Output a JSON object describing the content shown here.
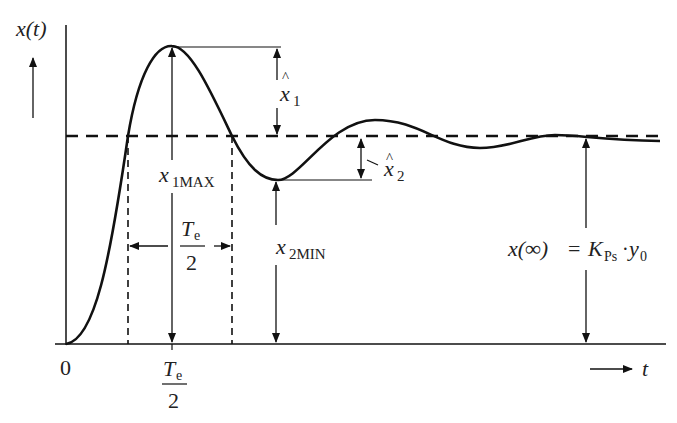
{
  "diagram": {
    "type": "step-response-overshoot",
    "y_axis_label": "x(t)",
    "x_axis_label": "t",
    "origin_label": "0",
    "labels": {
      "x1_hat": {
        "base": "x",
        "hat": "^",
        "sub": "1"
      },
      "x2_hat": {
        "base": "x",
        "hat": "^",
        "sub": "2"
      },
      "x1max": {
        "base": "x",
        "sub": "1MAX"
      },
      "x2min": {
        "base": "x",
        "sub": "2MIN"
      },
      "half_period": {
        "num": "T",
        "num_sub": "e",
        "den": "2"
      },
      "axis_tick": {
        "num": "T",
        "num_sub": "e",
        "den": "2"
      },
      "steady_state": {
        "lhs": "x(∞)",
        "eq": "=",
        "K": "K",
        "K_sub": "Ps",
        "dot": "·",
        "y": "y",
        "y_sub": "0"
      }
    }
  }
}
